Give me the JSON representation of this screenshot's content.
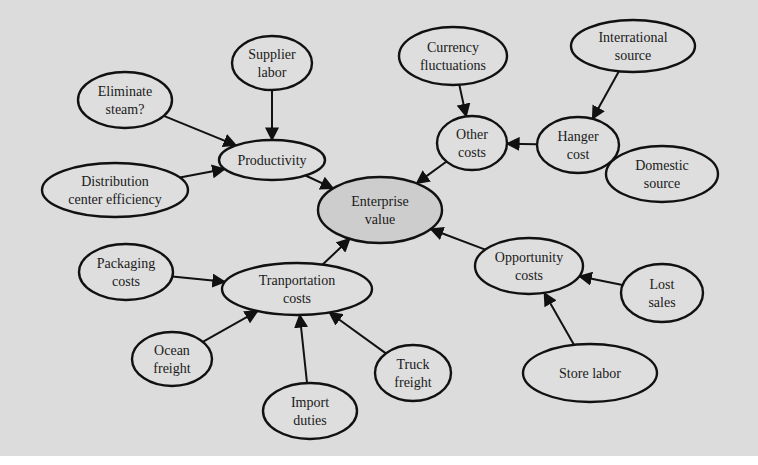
{
  "diagram": {
    "background": "#dcdcdc",
    "node_fill": "#dedede",
    "root_fill": "#cdcdcd",
    "stroke": "#111111",
    "nodes": [
      {
        "id": "enterprise_value",
        "lines": [
          "Enterprise",
          "value"
        ],
        "cx": 380,
        "cy": 210,
        "rx": 62,
        "ry": 33,
        "root": true
      },
      {
        "id": "productivity",
        "lines": [
          "Productivity"
        ],
        "cx": 272,
        "cy": 160,
        "rx": 53,
        "ry": 20
      },
      {
        "id": "supplier_labor",
        "lines": [
          "Supplier",
          "labor"
        ],
        "cx": 272,
        "cy": 63,
        "rx": 40,
        "ry": 27
      },
      {
        "id": "eliminate_steam",
        "lines": [
          "Eliminate",
          "steam?"
        ],
        "cx": 125,
        "cy": 100,
        "rx": 47,
        "ry": 28
      },
      {
        "id": "distribution_center_efficiency",
        "lines": [
          "Distribution",
          "center efficiency"
        ],
        "cx": 115,
        "cy": 190,
        "rx": 73,
        "ry": 27
      },
      {
        "id": "other_costs",
        "lines": [
          "Other",
          "costs"
        ],
        "cx": 472,
        "cy": 143,
        "rx": 35,
        "ry": 27
      },
      {
        "id": "currency_fluctuations",
        "lines": [
          "Currency",
          "fluctuations"
        ],
        "cx": 453,
        "cy": 56,
        "rx": 54,
        "ry": 29
      },
      {
        "id": "hanger_cost",
        "lines": [
          "Hanger",
          "cost"
        ],
        "cx": 578,
        "cy": 145,
        "rx": 41,
        "ry": 28
      },
      {
        "id": "international_source",
        "lines": [
          "Interrational",
          "source"
        ],
        "cx": 633,
        "cy": 46,
        "rx": 62,
        "ry": 26
      },
      {
        "id": "domestic_source",
        "lines": [
          "Domestic",
          "source"
        ],
        "cx": 662,
        "cy": 174,
        "rx": 56,
        "ry": 28
      },
      {
        "id": "transportation_costs",
        "lines": [
          "Tranportation",
          "costs"
        ],
        "cx": 297,
        "cy": 289,
        "rx": 75,
        "ry": 26
      },
      {
        "id": "packaging_costs",
        "lines": [
          "Packaging",
          "costs"
        ],
        "cx": 126,
        "cy": 272,
        "rx": 47,
        "ry": 28
      },
      {
        "id": "ocean_freight",
        "lines": [
          "Ocean",
          "freight"
        ],
        "cx": 172,
        "cy": 359,
        "rx": 40,
        "ry": 27
      },
      {
        "id": "import_duties",
        "lines": [
          "Import",
          "duties"
        ],
        "cx": 310,
        "cy": 411,
        "rx": 47,
        "ry": 28
      },
      {
        "id": "truck_freight",
        "lines": [
          "Truck",
          "freight"
        ],
        "cx": 413,
        "cy": 373,
        "rx": 38,
        "ry": 28
      },
      {
        "id": "opportunity_costs",
        "lines": [
          "Opportunity",
          "costs"
        ],
        "cx": 529,
        "cy": 266,
        "rx": 54,
        "ry": 28
      },
      {
        "id": "lost_sales",
        "lines": [
          "Lost",
          "sales"
        ],
        "cx": 662,
        "cy": 293,
        "rx": 41,
        "ry": 29
      },
      {
        "id": "store_labor",
        "lines": [
          "Store labor"
        ],
        "cx": 590,
        "cy": 373,
        "rx": 67,
        "ry": 29
      }
    ],
    "edges": [
      {
        "from": "supplier_labor",
        "to": "productivity"
      },
      {
        "from": "eliminate_steam",
        "to": "productivity"
      },
      {
        "from": "distribution_center_efficiency",
        "to": "productivity"
      },
      {
        "from": "productivity",
        "to": "enterprise_value"
      },
      {
        "from": "currency_fluctuations",
        "to": "other_costs"
      },
      {
        "from": "international_source",
        "to": "hanger_cost"
      },
      {
        "from": "domestic_source",
        "to": "hanger_cost"
      },
      {
        "from": "hanger_cost",
        "to": "other_costs"
      },
      {
        "from": "other_costs",
        "to": "enterprise_value"
      },
      {
        "from": "packaging_costs",
        "to": "transportation_costs"
      },
      {
        "from": "ocean_freight",
        "to": "transportation_costs"
      },
      {
        "from": "import_duties",
        "to": "transportation_costs"
      },
      {
        "from": "truck_freight",
        "to": "transportation_costs"
      },
      {
        "from": "transportation_costs",
        "to": "enterprise_value"
      },
      {
        "from": "lost_sales",
        "to": "opportunity_costs"
      },
      {
        "from": "store_labor",
        "to": "opportunity_costs"
      },
      {
        "from": "opportunity_costs",
        "to": "enterprise_value"
      }
    ]
  }
}
